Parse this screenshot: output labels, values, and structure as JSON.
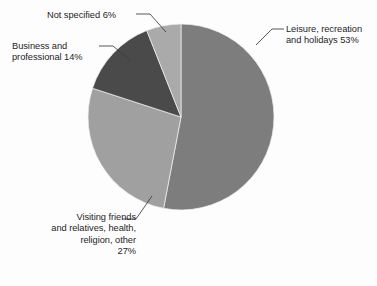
{
  "figure": {
    "title_cutoff": "",
    "background_color": "#fdfdfe"
  },
  "labels": {
    "leisure": "Leisure, recreation\nand holidays 53%",
    "visiting": "Visiting friends\nand relatives, health,\nreligion, other\n27%",
    "business": "Business and\nprofessional 14%",
    "not_specified": "Not specified 6%"
  },
  "chart_data": {
    "type": "pie",
    "title": "",
    "xlabel": "",
    "ylabel": "",
    "legend_position": "none",
    "grid": false,
    "start_angle_deg": 0,
    "direction": "clockwise",
    "unit": "%",
    "categories": [
      "Leisure, recreation and holidays",
      "Visiting friends and relatives, health, religion, other",
      "Business and professional",
      "Not specified"
    ],
    "values": [
      53,
      27,
      14,
      6
    ],
    "colors": [
      "#7d7d7d",
      "#a0a0a0",
      "#4a4a4a",
      "#aaaaaa"
    ],
    "slices": [
      {
        "name": "Leisure, recreation and holidays",
        "value": 53,
        "label": "Leisure, recreation and holidays 53%",
        "color": "#7d7d7d",
        "start_deg": 0,
        "end_deg": 190.8
      },
      {
        "name": "Visiting friends and relatives, health, religion, other",
        "value": 27,
        "label": "Visiting friends and relatives, health, religion, other 27%",
        "color": "#a0a0a0",
        "start_deg": 190.8,
        "end_deg": 288.0
      },
      {
        "name": "Business and professional",
        "value": 14,
        "label": "Business and professional 14%",
        "color": "#4a4a4a",
        "start_deg": 288.0,
        "end_deg": 338.4
      },
      {
        "name": "Not specified",
        "value": 6,
        "label": "Not specified 6%",
        "color": "#aaaaaa",
        "start_deg": 338.4,
        "end_deg": 360.0
      }
    ],
    "total": 100
  }
}
